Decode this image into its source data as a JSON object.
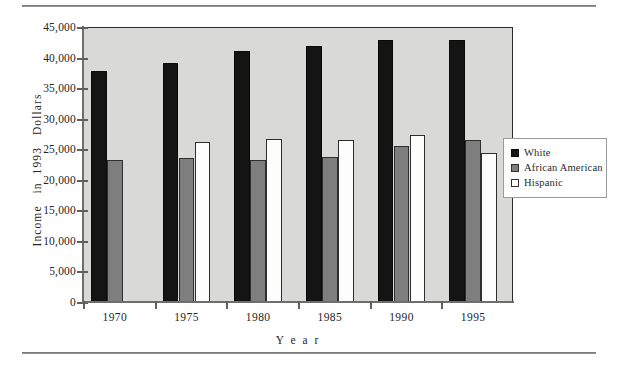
{
  "chart_data": {
    "type": "bar",
    "title": "",
    "xlabel": "Year",
    "ylabel": "Income  in  1993  Dollars",
    "categories": [
      "1970",
      "1975",
      "1980",
      "1985",
      "1990",
      "1995"
    ],
    "series": [
      {
        "name": "White",
        "color": "#141414",
        "values": [
          37800,
          39100,
          41000,
          41900,
          42900,
          42900
        ]
      },
      {
        "name": "African  American",
        "color": "#7e7e7e",
        "values": [
          23200,
          23600,
          23200,
          23800,
          25500,
          26500
        ]
      },
      {
        "name": "Hispanic",
        "color": "#ffffff",
        "values": [
          null,
          26200,
          26700,
          26500,
          27300,
          24400
        ]
      }
    ],
    "ylim": [
      0,
      45000
    ],
    "yticks": [
      0,
      5000,
      10000,
      15000,
      20000,
      25000,
      30000,
      35000,
      40000,
      45000
    ],
    "ytick_labels": [
      "0",
      "5,000",
      "10,000",
      "15,000",
      "20,000",
      "25,000",
      "30,000",
      "35,000",
      "40,000",
      "45,000"
    ],
    "grid": false,
    "legend_position": "right",
    "plot_background": "#d9d9d7"
  },
  "legend": {
    "entries": [
      {
        "label": "White"
      },
      {
        "label": "African   American"
      },
      {
        "label": "Hispanic"
      }
    ]
  },
  "axes": {
    "x_title": "Y e a r",
    "y_title": "Income   in  1993   Dollars"
  }
}
